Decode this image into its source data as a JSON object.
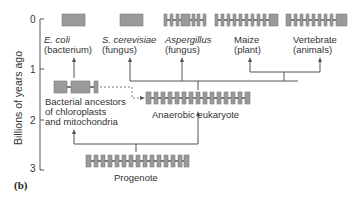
{
  "figure": {
    "panel_label": "(b)",
    "axis": {
      "label": "Billions of years ago",
      "ticks": [
        "0",
        "1",
        "2",
        "3"
      ]
    },
    "organisms": [
      {
        "id": "ecoli",
        "name": "E. coli",
        "sub": "(bacterium)",
        "gene": "continuous"
      },
      {
        "id": "scerevisiae",
        "name": "S. cerevisiae",
        "sub": "(fungus)",
        "gene": "continuous"
      },
      {
        "id": "aspergillus",
        "name": "Aspergillus",
        "sub": "(fungus)",
        "gene": "few-introns"
      },
      {
        "id": "maize",
        "name": "Maize",
        "sub": "(plant)",
        "gene": "many-introns"
      },
      {
        "id": "vertebrate",
        "name": "Vertebrate",
        "sub": "(animals)",
        "gene": "many-introns"
      }
    ],
    "ancestors": {
      "bacterial": {
        "line1": "Bacterial ancestors",
        "line2": "of chloroplasts",
        "line3": "and mitochondria"
      },
      "anaerobic": {
        "label": "Anaerobic eukaryote"
      },
      "progenote": {
        "label": "Progenote"
      }
    },
    "colors": {
      "exon": "#9a9a9a",
      "line": "#555555",
      "text": "#333333"
    }
  }
}
